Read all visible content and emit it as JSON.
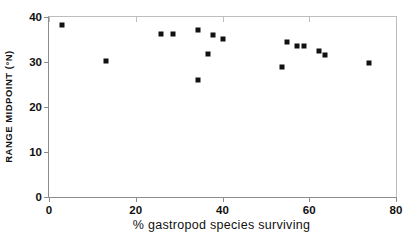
{
  "chart_data": {
    "type": "scatter",
    "title": "",
    "xlabel": "% gastropod species surviving",
    "ylabel": "RANGE MIDPOINT (°N)",
    "xlim": [
      0,
      80
    ],
    "ylim": [
      0,
      40
    ],
    "xticks": [
      0,
      20,
      40,
      60,
      80
    ],
    "yticks": [
      0,
      10,
      20,
      30,
      40
    ],
    "xtick_labels": [
      "0",
      "20",
      "40",
      "60",
      "80"
    ],
    "ytick_labels": [
      "0",
      "10",
      "20",
      "30",
      "40"
    ],
    "grid": false,
    "legend": null,
    "marker": {
      "shape": "square",
      "color": "#111111",
      "size": 5
    },
    "points": [
      {
        "x": 3.0,
        "y": 38.2
      },
      {
        "x": 13.1,
        "y": 30.2
      },
      {
        "x": 25.8,
        "y": 36.2
      },
      {
        "x": 28.6,
        "y": 36.2
      },
      {
        "x": 34.3,
        "y": 37.1
      },
      {
        "x": 34.3,
        "y": 26.0
      },
      {
        "x": 36.6,
        "y": 31.8
      },
      {
        "x": 37.8,
        "y": 36.0
      },
      {
        "x": 40.1,
        "y": 35.1
      },
      {
        "x": 53.7,
        "y": 28.9
      },
      {
        "x": 54.8,
        "y": 34.4
      },
      {
        "x": 57.1,
        "y": 33.6
      },
      {
        "x": 58.8,
        "y": 33.6
      },
      {
        "x": 62.2,
        "y": 32.4
      },
      {
        "x": 63.6,
        "y": 31.6
      },
      {
        "x": 73.7,
        "y": 29.8
      }
    ]
  }
}
